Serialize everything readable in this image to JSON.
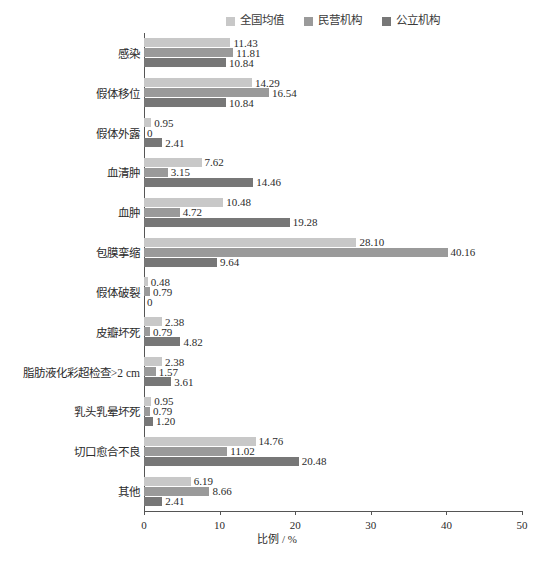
{
  "chart_data": {
    "type": "bar",
    "orientation": "horizontal",
    "title": "",
    "xlabel": "比例 / %",
    "ylabel": "",
    "xlim": [
      0,
      50
    ],
    "xticks": [
      0,
      10,
      20,
      30,
      40,
      50
    ],
    "grid": false,
    "legend_position": "top-right",
    "categories": [
      "感染",
      "假体移位",
      "假体外露",
      "血清肿",
      "血肿",
      "包膜挛缩",
      "假体破裂",
      "皮瓣坏死",
      "脂肪液化彩超检查>2 cm",
      "乳头乳晕坏死",
      "切口愈合不良",
      "其他"
    ],
    "series": [
      {
        "name": "全国均值",
        "color": "#c8c8c8",
        "values": [
          11.43,
          14.29,
          0.95,
          7.62,
          10.48,
          28.1,
          0.48,
          2.38,
          2.38,
          0.95,
          14.76,
          6.19
        ],
        "labels": [
          "11.43",
          "14.29",
          "0.95",
          "7.62",
          "10.48",
          "28.10",
          "0.48",
          "2.38",
          "2.38",
          "0.95",
          "14.76",
          "6.19"
        ]
      },
      {
        "name": "民营机构",
        "color": "#9a9a9a",
        "values": [
          11.81,
          16.54,
          0,
          3.15,
          4.72,
          40.16,
          0.79,
          0.79,
          1.57,
          0.79,
          11.02,
          8.66
        ],
        "labels": [
          "11.81",
          "16.54",
          "0",
          "3.15",
          "4.72",
          "40.16",
          "0.79",
          "0.79",
          "1.57",
          "0.79",
          "11.02",
          "8.66"
        ]
      },
      {
        "name": "公立机构",
        "color": "#777777",
        "values": [
          10.84,
          10.84,
          2.41,
          14.46,
          19.28,
          9.64,
          0,
          4.82,
          3.61,
          1.2,
          20.48,
          2.41
        ],
        "labels": [
          "10.84",
          "10.84",
          "2.41",
          "14.46",
          "19.28",
          "9.64",
          "0",
          "4.82",
          "3.61",
          "1.20",
          "20.48",
          "2.41"
        ]
      }
    ]
  },
  "legend": {
    "items": [
      {
        "label": "全国均值",
        "color": "#c8c8c8"
      },
      {
        "label": "民营机构",
        "color": "#9a9a9a"
      },
      {
        "label": "公立机构",
        "color": "#777777"
      }
    ]
  },
  "axis": {
    "x_title": "比例 / %",
    "x_tick_labels": [
      "0",
      "10",
      "20",
      "30",
      "40",
      "50"
    ]
  }
}
